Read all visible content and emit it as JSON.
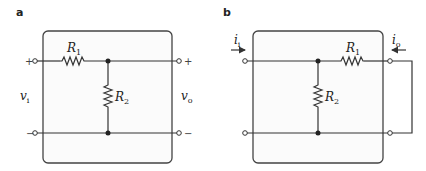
{
  "panels": [
    {
      "id": "a",
      "label": "a",
      "components": {
        "R1": {
          "name": "R",
          "sub": "1"
        },
        "R2": {
          "name": "R",
          "sub": "2"
        }
      },
      "input_voltage": {
        "name": "v",
        "sub": "i"
      },
      "output_voltage": {
        "name": "v",
        "sub": "o"
      },
      "terminal_signs": {
        "top_left": "+",
        "bottom_left": "−",
        "top_right": "+",
        "bottom_right": "−"
      }
    },
    {
      "id": "b",
      "label": "b",
      "components": {
        "R1": {
          "name": "R",
          "sub": "1"
        },
        "R2": {
          "name": "R",
          "sub": "2"
        }
      },
      "input_current": {
        "name": "i",
        "sub": "i"
      },
      "output_current": {
        "name": "i",
        "sub": "o"
      },
      "output_port": "short-circuited"
    }
  ]
}
